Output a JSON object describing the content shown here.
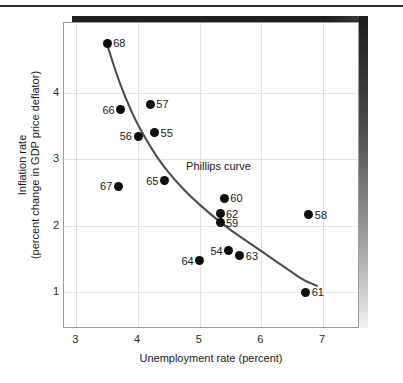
{
  "chart_data": {
    "type": "scatter",
    "title": "",
    "xlabel": "Unemployment rate (percent)",
    "ylabel_line1": "Inflation rate",
    "ylabel_line2": "(percent change in GDP price deflator)",
    "xlim": [
      2.8,
      7.6
    ],
    "ylim": [
      0.45,
      5.05
    ],
    "xticks": [
      3,
      4,
      5,
      6,
      7
    ],
    "yticks": [
      1,
      2,
      3,
      4
    ],
    "grid": true,
    "legend": "none",
    "annotations": [
      {
        "text": "Phillips curve",
        "x": 4.78,
        "y": 2.88
      }
    ],
    "series": [
      {
        "name": "U.S. inflation and unemployment, 1954-1968",
        "point_label_key": "year",
        "points": [
          {
            "year": "68",
            "x": 3.5,
            "y": 4.75,
            "label_side": "right"
          },
          {
            "year": "66",
            "x": 3.72,
            "y": 3.75,
            "label_side": "left"
          },
          {
            "year": "57",
            "x": 4.2,
            "y": 3.83,
            "label_side": "right"
          },
          {
            "year": "56",
            "x": 4.0,
            "y": 3.35,
            "label_side": "left"
          },
          {
            "year": "55",
            "x": 4.27,
            "y": 3.4,
            "label_side": "right"
          },
          {
            "year": "67",
            "x": 3.68,
            "y": 2.6,
            "label_side": "left"
          },
          {
            "year": "65",
            "x": 4.43,
            "y": 2.68,
            "label_side": "left"
          },
          {
            "year": "60",
            "x": 5.4,
            "y": 2.42,
            "label_side": "right"
          },
          {
            "year": "62",
            "x": 5.33,
            "y": 2.18,
            "label_side": "right"
          },
          {
            "year": "59",
            "x": 5.33,
            "y": 2.05,
            "label_side": "right"
          },
          {
            "year": "58",
            "x": 6.77,
            "y": 2.17,
            "label_side": "right"
          },
          {
            "year": "54",
            "x": 5.47,
            "y": 1.63,
            "label_side": "left"
          },
          {
            "year": "63",
            "x": 5.65,
            "y": 1.55,
            "label_side": "right"
          },
          {
            "year": "64",
            "x": 5.0,
            "y": 1.48,
            "label_side": "left"
          },
          {
            "year": "61",
            "x": 6.72,
            "y": 1.0,
            "label_side": "right"
          }
        ]
      }
    ],
    "fitted_curve": {
      "name": "Phillips curve",
      "color": "#4d4d4d",
      "points": [
        {
          "x": 3.5,
          "y": 4.72
        },
        {
          "x": 3.7,
          "y": 4.16
        },
        {
          "x": 3.9,
          "y": 3.71
        },
        {
          "x": 4.1,
          "y": 3.35
        },
        {
          "x": 4.3,
          "y": 3.05
        },
        {
          "x": 4.5,
          "y": 2.8
        },
        {
          "x": 4.75,
          "y": 2.54
        },
        {
          "x": 5.0,
          "y": 2.32
        },
        {
          "x": 5.25,
          "y": 2.12
        },
        {
          "x": 5.5,
          "y": 1.94
        },
        {
          "x": 5.75,
          "y": 1.78
        },
        {
          "x": 6.0,
          "y": 1.62
        },
        {
          "x": 6.25,
          "y": 1.46
        },
        {
          "x": 6.5,
          "y": 1.3
        },
        {
          "x": 6.7,
          "y": 1.18
        },
        {
          "x": 6.9,
          "y": 1.1
        }
      ]
    }
  }
}
